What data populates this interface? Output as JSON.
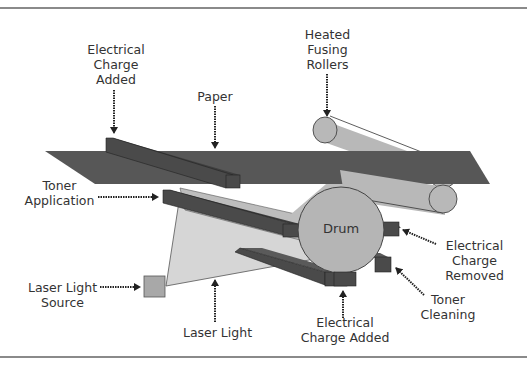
{
  "diagram": {
    "labels": {
      "charge_added_top": "Electrical\nCharge\nAdded",
      "paper": "Paper",
      "fusing_rollers": "Heated\nFusing\nRollers",
      "toner_application": "Toner\nApplication",
      "drum": "Drum",
      "charge_removed": "Electrical\nCharge\nRemoved",
      "laser_source": "Laser Light\nSource",
      "toner_cleaning": "Toner\nCleaning",
      "laser_light": "Laser Light",
      "charge_added_bottom": "Electrical\nCharge Added"
    },
    "colors": {
      "paper": "#555555",
      "bar": "#4a4a4a",
      "bar_top": "#3a3a3a",
      "roller": "#b8b8b8",
      "drum": "#b5b5b5",
      "laser_beam": "#d0d0d0",
      "laser_source": "#a8a8a8",
      "text": "#333333",
      "rule": "#8a8a8a"
    }
  }
}
